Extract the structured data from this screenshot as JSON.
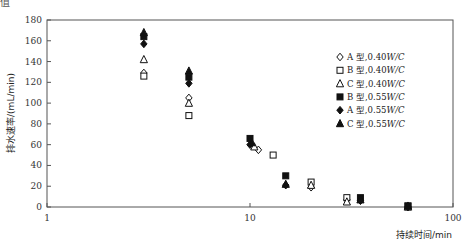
{
  "figure": {
    "corner_fragment": "值"
  },
  "chart_data": {
    "type": "scatter",
    "title": "",
    "xlabel": "持续时间/min",
    "ylabel": "排水速率/(mL/min)",
    "xscale": "log",
    "xlim": [
      1,
      100
    ],
    "ylim": [
      0,
      180
    ],
    "xticks": [
      1,
      10,
      100
    ],
    "xtick_labels": [
      "1",
      "10",
      "100"
    ],
    "yticks": [
      0,
      20,
      40,
      60,
      80,
      100,
      120,
      140,
      160,
      180
    ],
    "ytick_labels": [
      "0",
      "20",
      "40",
      "60",
      "80",
      "100",
      "120",
      "140",
      "160",
      "180"
    ],
    "grid": false,
    "legend_position": "right-inside",
    "series": [
      {
        "name": "A 型,0.40W/C",
        "marker": "diamond-open",
        "x": [
          3,
          5,
          11,
          20,
          30,
          60
        ],
        "y": [
          129,
          105,
          55,
          19,
          7,
          0
        ]
      },
      {
        "name": "B 型,0.40W/C",
        "marker": "square-open",
        "x": [
          3,
          5,
          13,
          20,
          30,
          60
        ],
        "y": [
          126,
          88,
          50,
          24,
          9,
          1
        ]
      },
      {
        "name": "C 型,0.40W/C",
        "marker": "triangle-open",
        "x": [
          3,
          5,
          10.5,
          20,
          30,
          60
        ],
        "y": [
          142,
          100,
          58,
          21,
          5,
          0
        ]
      },
      {
        "name": "B 型,0.55W/C",
        "marker": "square-filled",
        "x": [
          3,
          5,
          10,
          15,
          35,
          60
        ],
        "y": [
          164,
          125,
          66,
          30,
          9,
          1
        ]
      },
      {
        "name": "A 型,0.55W/C",
        "marker": "diamond-filled",
        "x": [
          3,
          5,
          10,
          15,
          35,
          60
        ],
        "y": [
          157,
          119,
          60,
          21,
          6,
          0
        ]
      },
      {
        "name": "C 型,0.55W/C",
        "marker": "triangle-filled",
        "x": [
          3,
          5,
          10.2,
          15,
          35,
          60
        ],
        "y": [
          168,
          131,
          62,
          22,
          7,
          1
        ]
      }
    ]
  }
}
